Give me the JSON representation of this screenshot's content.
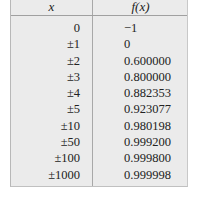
{
  "table": {
    "headers": {
      "x": "x",
      "fx": "f(x)"
    },
    "rows": [
      {
        "x": "0",
        "fx": "−1"
      },
      {
        "x": "±1",
        "fx": "0"
      },
      {
        "x": "±2",
        "fx": "0.600000"
      },
      {
        "x": "±3",
        "fx": "0.800000"
      },
      {
        "x": "±4",
        "fx": "0.882353"
      },
      {
        "x": "±5",
        "fx": "0.923077"
      },
      {
        "x": "±10",
        "fx": "0.980198"
      },
      {
        "x": "±50",
        "fx": "0.999200"
      },
      {
        "x": "±100",
        "fx": "0.999800"
      },
      {
        "x": "±1000",
        "fx": "0.999998"
      }
    ]
  },
  "colors": {
    "table_background": "#ebebeb",
    "rule_lines": "#a8a8a8",
    "text": "#222222"
  }
}
